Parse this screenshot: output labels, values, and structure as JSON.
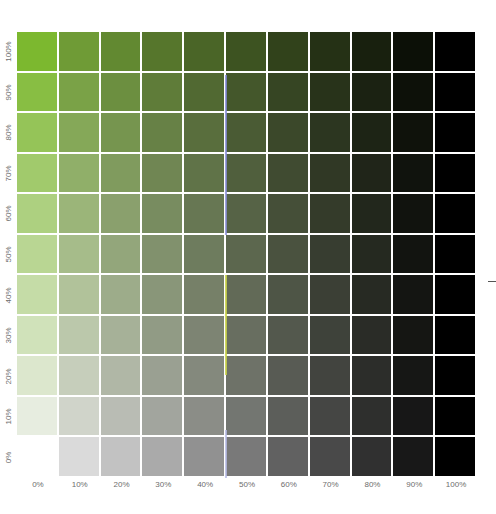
{
  "chart_data": {
    "type": "heatmap",
    "title": "",
    "xlabel": "",
    "ylabel": "",
    "x_ticks": [
      "0%",
      "10%",
      "20%",
      "30%",
      "40%",
      "50%",
      "60%",
      "70%",
      "80%",
      "90%",
      "100%"
    ],
    "y_ticks": [
      "100%",
      "90%",
      "80%",
      "70%",
      "60%",
      "50%",
      "40%",
      "30%",
      "20%",
      "10%",
      "0%"
    ],
    "base_color": "#7cb82f",
    "grid_color": "#f2f4ea",
    "rows": 11,
    "cols": 11
  },
  "labels": {
    "x": [
      "0%",
      "10%",
      "20%",
      "30%",
      "40%",
      "50%",
      "60%",
      "70%",
      "80%",
      "90%",
      "100%"
    ],
    "y": [
      "100%",
      "90%",
      "80%",
      "70%",
      "60%",
      "50%",
      "40%",
      "30%",
      "20%",
      "10%",
      "0%"
    ]
  }
}
